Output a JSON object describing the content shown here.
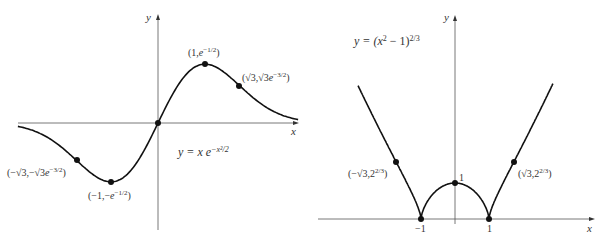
{
  "chart_data": [
    {
      "type": "line",
      "title": "y = x e^{-x^2/2}",
      "equation_label": "y = x e^{-x^2/2}",
      "xlabel": "x",
      "ylabel": "y",
      "grid": false,
      "xlim": [
        -3,
        3
      ],
      "ylim": [
        -1.2,
        1.1
      ],
      "function": "x*exp(-x^2/2)",
      "annotated_points": [
        {
          "label": "(1, e^{-1/2})",
          "x": 1,
          "y": 0.6065
        },
        {
          "label": "(√3, √3e^{-3/2})",
          "x": 1.732,
          "y": 0.3865
        },
        {
          "label": "(0, 0)",
          "x": 0,
          "y": 0
        },
        {
          "label": "(−1, −e^{-1/2})",
          "x": -1,
          "y": -0.6065
        },
        {
          "label": "(−√3, −√3e^{-3/2})",
          "x": -1.732,
          "y": -0.3865
        }
      ]
    },
    {
      "type": "line",
      "title": "y = (x^2 − 1)^{2/3}",
      "equation_label": "y = (x^2 − 1)^{2/3}",
      "xlabel": "x",
      "ylabel": "y",
      "grid": false,
      "xlim": [
        -3,
        3
      ],
      "ylim": [
        0,
        5
      ],
      "function": "(x^2-1)^(2/3)",
      "x_tick_labels": [
        "−1",
        "1"
      ],
      "y_tick_labels": [
        "1"
      ],
      "annotated_points": [
        {
          "label": "(−√3, 2^{2/3})",
          "x": -1.732,
          "y": 1.587
        },
        {
          "label": "(√3, 2^{2/3})",
          "x": 1.732,
          "y": 1.587
        },
        {
          "label": "1",
          "x": 0,
          "y": 1
        },
        {
          "label": "−1",
          "x": -1,
          "y": 0
        },
        {
          "label": "1",
          "x": 1,
          "y": 0
        }
      ]
    }
  ],
  "left": {
    "ylabel": "y",
    "xlabel": "x",
    "eq_prefix": "y = x e",
    "eq_sup": "−x²/2",
    "pt_max": {
      "a": "(1,",
      "b": "e",
      "c": "−1/2",
      "d": ")"
    },
    "pt_infl_pos": {
      "a": "(√3,√3",
      "b": "e",
      "c": "−3/2",
      "d": ")"
    },
    "pt_min": {
      "a": "(−1,−",
      "b": "e",
      "c": "−1/2",
      "d": ")"
    },
    "pt_infl_neg": {
      "a": "(−√3,−√3",
      "b": "e",
      "c": "−3/2",
      "d": ")"
    }
  },
  "right": {
    "ylabel": "y",
    "xlabel": "x",
    "eq_prefix": "y = (",
    "eq_x": "x",
    "eq_mid": "2",
    "eq_rest": " − 1)",
    "eq_sup": "2/3",
    "pt_left": {
      "a": "(−√3,2",
      "c": "2/3",
      "d": ")"
    },
    "pt_right": {
      "a": "(√3,2",
      "c": "2/3",
      "d": ")"
    },
    "tick_neg1": "−1",
    "tick_pos1": "1",
    "tick_y1": "1"
  }
}
